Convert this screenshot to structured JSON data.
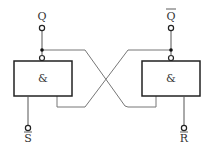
{
  "diagram": {
    "gates": [
      {
        "id": "left",
        "symbol": "&"
      },
      {
        "id": "right",
        "symbol": "&"
      }
    ],
    "outputs": {
      "left": "Q",
      "right": "Q"
    },
    "output_right_overbar": true,
    "inputs": {
      "left": "S",
      "right": "R"
    },
    "inputs_overbar": true,
    "colors": {
      "box": "#222222",
      "wire": "#777777",
      "text": "#333333"
    }
  }
}
